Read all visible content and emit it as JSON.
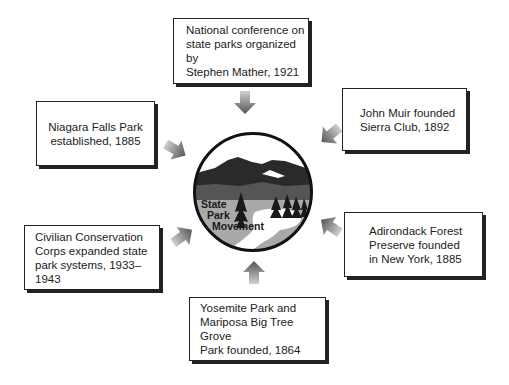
{
  "diagram": {
    "center": {
      "label_lines": [
        "State",
        "Park",
        "Movement"
      ],
      "colors": {
        "ring": "#111111",
        "mountains_dark": "#2a2a2a",
        "mountains_mid": "#555555",
        "water": "#a8a8a8",
        "snow": "#ffffff",
        "sky": "#ffffff"
      }
    },
    "boxes": [
      {
        "id": "national-conference",
        "text": "National conference on\nstate parks organized by\nStephen Mather, 1921"
      },
      {
        "id": "john-muir",
        "text": "John Muir founded\nSierra Club, 1892"
      },
      {
        "id": "adirondack",
        "text": "Adirondack Forest\nPreserve founded\nin New York, 1885"
      },
      {
        "id": "yosemite",
        "text": "Yosemite Park and\nMariposa Big Tree Grove\nPark founded, 1864"
      },
      {
        "id": "civilian-conservation",
        "text": "Civilian Conservation\nCorps expanded state\npark systems, 1933–1943"
      },
      {
        "id": "niagara",
        "text": "Niagara Falls Park\nestablished, 1885"
      }
    ],
    "arrow_color": "#777777"
  }
}
